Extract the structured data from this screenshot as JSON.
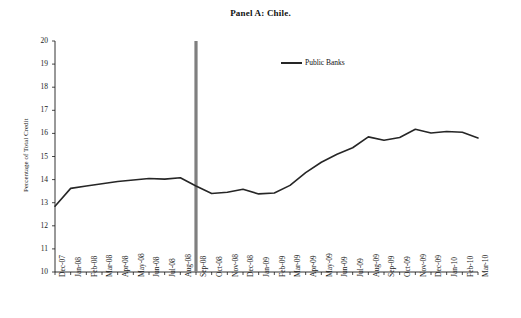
{
  "chart_data": {
    "type": "line",
    "title": "Panel A: Chile.",
    "xlabel": "",
    "ylabel": "Percentage of Total Credit",
    "ylim": [
      10,
      20
    ],
    "ytick_step": 1,
    "yticks": [
      20,
      19,
      18,
      17,
      16,
      15,
      14,
      13,
      12,
      11,
      10
    ],
    "grid": false,
    "legend_position": "top-center",
    "legend": [
      "Public Banks"
    ],
    "line_color": "#262626",
    "marker_line_color": "#7f7f7f",
    "marker_line_x_category": "Sep-08",
    "categories": [
      "Dec-07",
      "Jan-08",
      "Feb-08",
      "Mar-08",
      "Apr-08",
      "May-08",
      "Jun-08",
      "Jul-08",
      "Aug-08",
      "Sep-08",
      "Oct-08",
      "Nov-08",
      "Dec-08",
      "Jan-09",
      "Feb-09",
      "Mar-09",
      "Apr-09",
      "May-09",
      "Jun-09",
      "Jul-09",
      "Aug-09",
      "Sep-09",
      "Oct-09",
      "Nov-09",
      "Dec-09",
      "Jan-10",
      "Feb-10",
      "Mar-10"
    ],
    "series": [
      {
        "name": "Public Banks",
        "values": [
          12.85,
          13.62,
          13.72,
          13.82,
          13.92,
          13.98,
          14.05,
          14.02,
          14.08,
          13.72,
          13.4,
          13.45,
          13.58,
          13.38,
          13.42,
          13.75,
          14.3,
          14.75,
          15.1,
          15.38,
          15.85,
          15.7,
          15.82,
          16.18,
          16.02,
          16.08,
          16.05,
          15.8
        ]
      }
    ]
  }
}
